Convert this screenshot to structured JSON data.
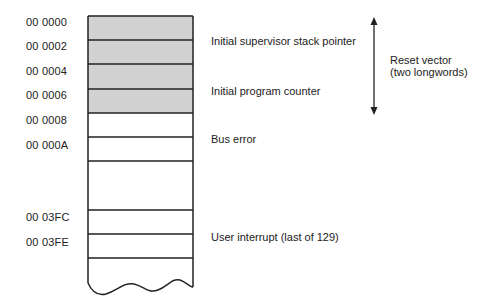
{
  "diagram": {
    "addresses": [
      {
        "text": "00 0000",
        "y": 23
      },
      {
        "text": "00 0002",
        "y": 47
      },
      {
        "text": "00 0004",
        "y": 72
      },
      {
        "text": "00 0006",
        "y": 96
      },
      {
        "text": "00 0008",
        "y": 121
      },
      {
        "text": "00 000A",
        "y": 146
      },
      {
        "text": "00 03FC",
        "y": 218
      },
      {
        "text": "00 03FE",
        "y": 243
      }
    ],
    "labels": [
      {
        "text": "Initial supervisor stack pointer",
        "x": 211,
        "y": 35
      },
      {
        "text": "Initial program counter",
        "x": 211,
        "y": 85
      },
      {
        "text": "Bus error",
        "x": 211,
        "y": 133
      },
      {
        "text": "User interrupt (last of 129)",
        "x": 211,
        "y": 231
      }
    ],
    "bracket": {
      "line1": "Reset vector",
      "line2": "(two longwords)"
    },
    "colors": {
      "shaded_fill": "#d2d2d2",
      "line": "#222222"
    }
  }
}
